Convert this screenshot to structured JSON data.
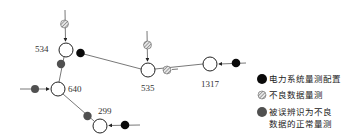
{
  "diagram": {
    "type": "power-network-measurement-diagram",
    "nodes": [
      {
        "id": "534",
        "label": "534"
      },
      {
        "id": "640",
        "label": "640"
      },
      {
        "id": "299",
        "label": "299"
      },
      {
        "id": "535",
        "label": "535"
      },
      {
        "id": "1317",
        "label": "1317"
      }
    ],
    "edges": [
      {
        "from": "534",
        "to": "640"
      },
      {
        "from": "534",
        "to": "535"
      },
      {
        "from": "640",
        "to": "299"
      },
      {
        "from": "535",
        "to": "1317"
      }
    ],
    "measurements": [
      {
        "at": "534",
        "kind": "bad-data",
        "position": "injection-top"
      },
      {
        "at": "534",
        "kind": "power-system-measurement",
        "position": "branch-534-535"
      },
      {
        "at": "534",
        "kind": "misidentified-normal",
        "position": "branch-534-640"
      },
      {
        "at": "640",
        "kind": "misidentified-normal",
        "position": "injection-left"
      },
      {
        "at": "640",
        "kind": "misidentified-normal",
        "position": "branch-640-299"
      },
      {
        "at": "299",
        "kind": "power-system-measurement",
        "position": "injection-right"
      },
      {
        "at": "535",
        "kind": "bad-data",
        "position": "injection-top"
      },
      {
        "at": "535",
        "kind": "bad-data",
        "position": "branch-535-1317"
      },
      {
        "at": "1317",
        "kind": "power-system-measurement",
        "position": "injection-right"
      }
    ]
  },
  "legend": {
    "items": [
      {
        "symbol": "black-filled-circle",
        "color": "#000000",
        "label": "电力系统量测配置"
      },
      {
        "symbol": "hatched-circle",
        "color": "#888888",
        "label": "不良数据量测"
      },
      {
        "symbol": "grey-filled-circle",
        "color": "#555555",
        "label_line1": "被误辨识为不良",
        "label_line2": "数据的正常量测"
      }
    ]
  },
  "colors": {
    "line": "#555555",
    "black_meas": "#0a0a0a",
    "grey_meas": "#505050",
    "hatch": "#777777"
  }
}
